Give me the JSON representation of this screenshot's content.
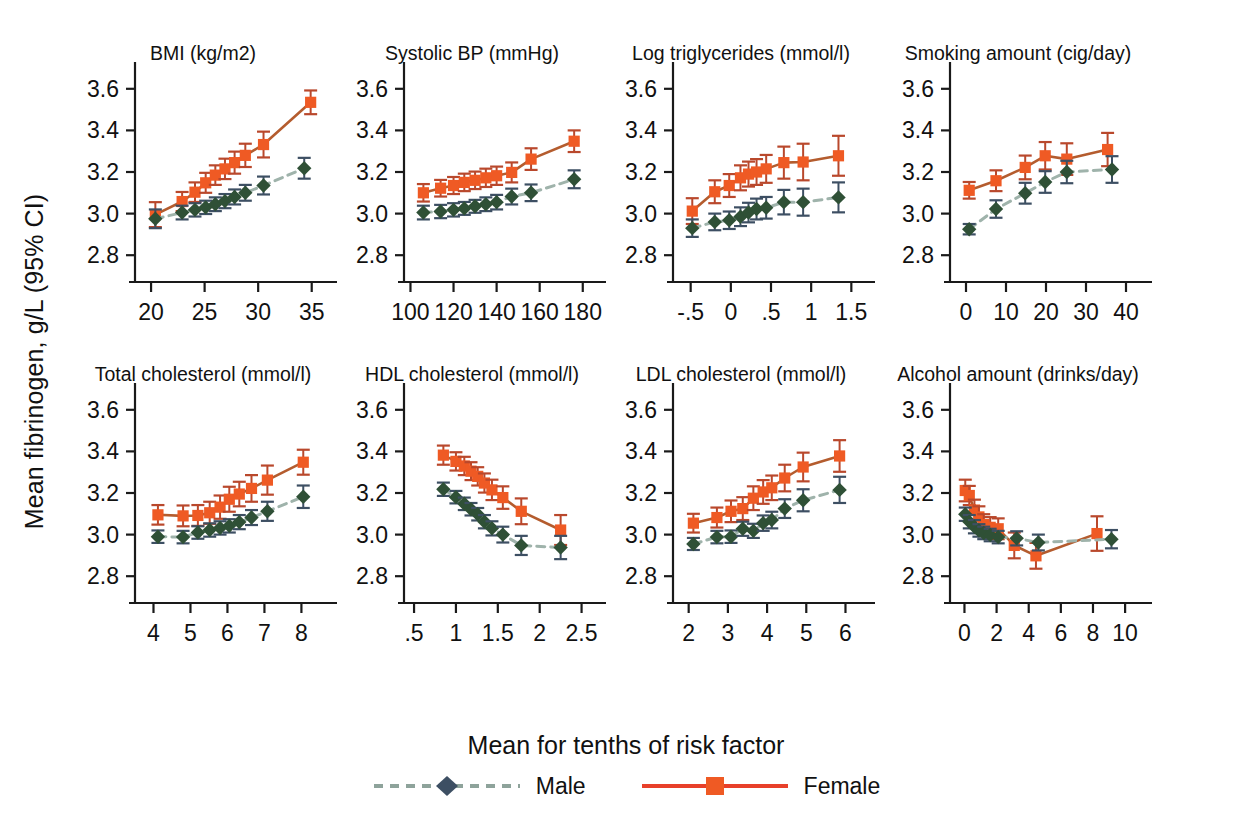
{
  "axis": {
    "ylabel": "Mean fibrinogen, g/L (95% CI)",
    "xlabel": "Mean for tenths of risk factor",
    "ylim": [
      2.7,
      3.7
    ],
    "yticks": [
      "2.8",
      "3.0",
      "3.2",
      "3.4",
      "3.6"
    ],
    "ytick_values": [
      2.8,
      3.0,
      3.2,
      3.4,
      3.6
    ]
  },
  "legend": {
    "position": "bottom-center",
    "items": [
      {
        "label": "Male",
        "marker": "diamond",
        "color": "#3d4f63",
        "line": "dashed",
        "line_color": "#8ea39b"
      },
      {
        "label": "Female",
        "marker": "square",
        "color": "#ef5a24",
        "line": "solid",
        "line_color": "#e03a26"
      }
    ]
  },
  "colors": {
    "female_marker": "#ef5a24",
    "female_line": "#b45c2e",
    "female_error": "#b9482c",
    "male_marker": "#2f5036",
    "male_line": "#9fb3ab",
    "male_error": "#3d4f63",
    "axis": "#1a1a1a"
  },
  "chart_data": [
    {
      "type": "scatter",
      "title": "BMI (kg/m2)",
      "xlabel": "",
      "ylabel": "Mean fibrinogen, g/L (95% CI)",
      "xlim": [
        18.5,
        36.8
      ],
      "ylim": [
        2.7,
        3.7
      ],
      "xticks": [
        "20",
        "25",
        "30",
        "35"
      ],
      "xtick_values": [
        20,
        25,
        30,
        35
      ],
      "grid": false,
      "series": [
        {
          "name": "Female",
          "x": [
            20.4,
            22.9,
            24.1,
            25.1,
            26.0,
            26.9,
            27.8,
            28.8,
            30.5,
            34.9
          ],
          "y": [
            2.995,
            3.058,
            3.103,
            3.148,
            3.185,
            3.215,
            3.245,
            3.28,
            3.332,
            3.535
          ],
          "lo": [
            2.935,
            3.012,
            3.056,
            3.1,
            3.138,
            3.166,
            3.192,
            3.224,
            3.27,
            3.478
          ],
          "hi": [
            3.055,
            3.104,
            3.15,
            3.196,
            3.232,
            3.264,
            3.298,
            3.336,
            3.394,
            3.592
          ]
        },
        {
          "name": "Male",
          "x": [
            20.4,
            22.9,
            24.1,
            25.1,
            26.0,
            26.9,
            27.8,
            28.8,
            30.5,
            34.3
          ],
          "y": [
            2.975,
            3.005,
            3.018,
            3.03,
            3.045,
            3.06,
            3.08,
            3.1,
            3.135,
            3.218
          ],
          "lo": [
            2.93,
            2.972,
            2.986,
            2.998,
            3.012,
            3.026,
            3.044,
            3.062,
            3.092,
            3.168
          ],
          "hi": [
            3.02,
            3.038,
            3.05,
            3.062,
            3.078,
            3.094,
            3.116,
            3.138,
            3.178,
            3.268
          ]
        }
      ]
    },
    {
      "type": "scatter",
      "title": "Systolic BP (mmHg)",
      "xlabel": "",
      "ylabel": "",
      "xlim": [
        97,
        188
      ],
      "ylim": [
        2.7,
        3.7
      ],
      "xticks": [
        "100",
        "120",
        "140",
        "160",
        "180"
      ],
      "xtick_values": [
        100,
        120,
        140,
        160,
        180
      ],
      "grid": false,
      "series": [
        {
          "name": "Female",
          "x": [
            106,
            114,
            120,
            125,
            130,
            135,
            140,
            147,
            156,
            176
          ],
          "y": [
            3.1,
            3.122,
            3.135,
            3.15,
            3.16,
            3.172,
            3.182,
            3.198,
            3.262,
            3.348
          ],
          "lo": [
            3.058,
            3.082,
            3.094,
            3.108,
            3.118,
            3.128,
            3.138,
            3.15,
            3.21,
            3.296
          ],
          "hi": [
            3.142,
            3.162,
            3.176,
            3.192,
            3.202,
            3.216,
            3.226,
            3.246,
            3.314,
            3.4
          ]
        },
        {
          "name": "Male",
          "x": [
            106,
            114,
            120,
            125,
            130,
            135,
            140,
            147,
            156,
            176
          ],
          "y": [
            3.005,
            3.01,
            3.018,
            3.025,
            3.035,
            3.045,
            3.055,
            3.082,
            3.1,
            3.165
          ],
          "lo": [
            2.972,
            2.978,
            2.986,
            2.994,
            3.004,
            3.012,
            3.02,
            3.044,
            3.06,
            3.122
          ],
          "hi": [
            3.038,
            3.042,
            3.05,
            3.056,
            3.066,
            3.078,
            3.09,
            3.12,
            3.14,
            3.208
          ]
        }
      ]
    },
    {
      "type": "scatter",
      "title": "Log triglycerides (mmol/l)",
      "xlabel": "",
      "ylabel": "",
      "xlim": [
        -0.72,
        1.72
      ],
      "ylim": [
        2.7,
        3.7
      ],
      "xticks": [
        "-.5",
        "0",
        ".5",
        "1",
        "1.5"
      ],
      "xtick_values": [
        -0.5,
        0,
        0.5,
        1,
        1.5
      ],
      "grid": false,
      "series": [
        {
          "name": "Female",
          "x": [
            -0.48,
            -0.2,
            -0.02,
            0.12,
            0.22,
            0.32,
            0.44,
            0.66,
            0.9,
            1.34
          ],
          "y": [
            3.012,
            3.105,
            3.135,
            3.172,
            3.19,
            3.2,
            3.215,
            3.245,
            3.248,
            3.278
          ],
          "lo": [
            2.95,
            3.05,
            3.08,
            3.112,
            3.13,
            3.138,
            3.148,
            3.168,
            3.16,
            3.182
          ],
          "hi": [
            3.074,
            3.16,
            3.19,
            3.232,
            3.25,
            3.262,
            3.282,
            3.322,
            3.336,
            3.374
          ]
        },
        {
          "name": "Male",
          "x": [
            -0.48,
            -0.2,
            -0.02,
            0.12,
            0.22,
            0.32,
            0.44,
            0.66,
            0.9,
            1.34
          ],
          "y": [
            2.93,
            2.96,
            2.968,
            2.985,
            3.005,
            3.022,
            3.028,
            3.055,
            3.055,
            3.078
          ],
          "lo": [
            2.888,
            2.92,
            2.926,
            2.94,
            2.958,
            2.972,
            2.976,
            2.996,
            2.99,
            3.006
          ],
          "hi": [
            2.972,
            3.0,
            3.01,
            3.03,
            3.052,
            3.072,
            3.08,
            3.114,
            3.12,
            3.15
          ]
        }
      ]
    },
    {
      "type": "scatter",
      "title": "Smoking amount (cig/day)",
      "xlabel": "",
      "ylabel": "",
      "xlim": [
        -4,
        45
      ],
      "ylim": [
        2.7,
        3.7
      ],
      "xticks": [
        "0",
        "10",
        "20",
        "30",
        "40"
      ],
      "xtick_values": [
        0,
        10,
        20,
        30,
        40
      ],
      "grid": false,
      "series": [
        {
          "name": "Female",
          "x": [
            0.8,
            7.5,
            14.8,
            19.8,
            25.2,
            35.4
          ],
          "y": [
            3.112,
            3.158,
            3.222,
            3.278,
            3.262,
            3.308
          ],
          "lo": [
            3.072,
            3.108,
            3.165,
            3.212,
            3.186,
            3.228
          ],
          "hi": [
            3.152,
            3.208,
            3.279,
            3.344,
            3.338,
            3.388
          ]
        },
        {
          "name": "Male",
          "x": [
            0.8,
            7.5,
            14.8,
            19.8,
            25.2,
            36.5
          ],
          "y": [
            2.925,
            3.022,
            3.098,
            3.152,
            3.2,
            3.212
          ],
          "lo": [
            2.9,
            2.98,
            3.048,
            3.1,
            3.146,
            3.148
          ],
          "hi": [
            2.95,
            3.064,
            3.148,
            3.204,
            3.254,
            3.276
          ]
        }
      ]
    },
    {
      "type": "scatter",
      "title": "Total cholesterol (mmol/l)",
      "xlabel": "",
      "ylabel": "",
      "xlim": [
        3.5,
        8.8
      ],
      "ylim": [
        2.7,
        3.7
      ],
      "xticks": [
        "4",
        "5",
        "6",
        "7",
        "8"
      ],
      "xtick_values": [
        4,
        5,
        6,
        7,
        8
      ],
      "grid": false,
      "series": [
        {
          "name": "Female",
          "x": [
            4.12,
            4.8,
            5.2,
            5.52,
            5.8,
            6.05,
            6.32,
            6.65,
            7.08,
            8.05
          ],
          "y": [
            3.095,
            3.09,
            3.092,
            3.105,
            3.132,
            3.17,
            3.195,
            3.222,
            3.262,
            3.348
          ],
          "lo": [
            3.048,
            3.04,
            3.042,
            3.052,
            3.076,
            3.11,
            3.136,
            3.158,
            3.192,
            3.288
          ],
          "hi": [
            3.142,
            3.14,
            3.142,
            3.158,
            3.188,
            3.23,
            3.254,
            3.286,
            3.332,
            3.408
          ]
        },
        {
          "name": "Male",
          "x": [
            4.12,
            4.8,
            5.2,
            5.52,
            5.8,
            6.05,
            6.32,
            6.65,
            7.08,
            8.05
          ],
          "y": [
            2.99,
            2.988,
            3.01,
            3.022,
            3.032,
            3.042,
            3.06,
            3.082,
            3.112,
            3.182
          ],
          "lo": [
            2.96,
            2.958,
            2.98,
            2.99,
            3.0,
            3.01,
            3.026,
            3.046,
            3.066,
            3.128
          ],
          "hi": [
            3.02,
            3.018,
            3.04,
            3.054,
            3.064,
            3.074,
            3.094,
            3.118,
            3.158,
            3.236
          ]
        }
      ]
    },
    {
      "type": "scatter",
      "title": "HDL cholesterol (mmol/l)",
      "xlabel": "",
      "ylabel": "",
      "xlim": [
        0.38,
        2.72
      ],
      "ylim": [
        2.7,
        3.7
      ],
      "xticks": [
        ".5",
        "1",
        "1.5",
        "2",
        "2.5"
      ],
      "xtick_values": [
        0.5,
        1,
        1.5,
        2,
        2.5
      ],
      "grid": false,
      "series": [
        {
          "name": "Female",
          "x": [
            0.85,
            1.0,
            1.1,
            1.18,
            1.26,
            1.34,
            1.43,
            1.56,
            1.78,
            2.25
          ],
          "y": [
            3.382,
            3.352,
            3.33,
            3.305,
            3.28,
            3.248,
            3.215,
            3.178,
            3.112,
            3.022
          ],
          "lo": [
            3.336,
            3.308,
            3.286,
            3.262,
            3.236,
            3.202,
            3.166,
            3.124,
            3.05,
            2.95
          ],
          "hi": [
            3.428,
            3.396,
            3.374,
            3.348,
            3.324,
            3.294,
            3.264,
            3.232,
            3.174,
            3.094
          ]
        },
        {
          "name": "Male",
          "x": [
            0.85,
            1.0,
            1.1,
            1.18,
            1.26,
            1.34,
            1.43,
            1.56,
            1.78,
            2.25
          ],
          "y": [
            3.218,
            3.18,
            3.148,
            3.122,
            3.098,
            3.062,
            3.03,
            3.0,
            2.948,
            2.938
          ],
          "lo": [
            3.186,
            3.15,
            3.118,
            3.092,
            3.068,
            3.03,
            2.996,
            2.962,
            2.902,
            2.882
          ],
          "hi": [
            3.25,
            3.21,
            3.178,
            3.152,
            3.128,
            3.094,
            3.064,
            3.038,
            2.994,
            2.994
          ]
        }
      ]
    },
    {
      "type": "scatter",
      "title": "LDL cholesterol (mmol/l)",
      "xlabel": "",
      "ylabel": "",
      "xlim": [
        1.6,
        6.6
      ],
      "ylim": [
        2.7,
        3.7
      ],
      "xticks": [
        "2",
        "3",
        "4",
        "5",
        "6"
      ],
      "xtick_values": [
        2,
        3,
        4,
        5,
        6
      ],
      "grid": false,
      "series": [
        {
          "name": "Female",
          "x": [
            2.12,
            2.72,
            3.08,
            3.38,
            3.65,
            3.9,
            4.12,
            4.45,
            4.92,
            5.85
          ],
          "y": [
            3.055,
            3.082,
            3.112,
            3.125,
            3.175,
            3.205,
            3.225,
            3.272,
            3.325,
            3.378
          ],
          "lo": [
            3.01,
            3.034,
            3.06,
            3.07,
            3.118,
            3.148,
            3.166,
            3.208,
            3.256,
            3.302
          ],
          "hi": [
            3.1,
            3.13,
            3.164,
            3.18,
            3.232,
            3.262,
            3.284,
            3.336,
            3.394,
            3.454
          ]
        },
        {
          "name": "Male",
          "x": [
            2.12,
            2.72,
            3.08,
            3.38,
            3.65,
            3.9,
            4.12,
            4.45,
            4.92,
            5.85
          ],
          "y": [
            2.955,
            2.988,
            2.99,
            3.028,
            3.018,
            3.055,
            3.07,
            3.125,
            3.165,
            3.215
          ],
          "lo": [
            2.926,
            2.958,
            2.96,
            2.994,
            2.984,
            3.018,
            3.03,
            3.08,
            3.112,
            3.152
          ],
          "hi": [
            2.984,
            3.018,
            3.02,
            3.062,
            3.052,
            3.092,
            3.11,
            3.17,
            3.218,
            3.278
          ]
        }
      ]
    },
    {
      "type": "scatter",
      "title": "Alcohol amount (drinks/day)",
      "xlabel": "",
      "ylabel": "",
      "xlim": [
        -0.9,
        11.3
      ],
      "ylim": [
        2.7,
        3.7
      ],
      "xticks": [
        "0",
        "2",
        "4",
        "6",
        "8",
        "10"
      ],
      "xtick_values": [
        0,
        2,
        4,
        6,
        8,
        10
      ],
      "grid": false,
      "series": [
        {
          "name": "Female",
          "x": [
            0.05,
            0.3,
            0.62,
            0.9,
            1.2,
            1.6,
            2.1,
            3.1,
            4.45,
            8.25
          ],
          "y": [
            3.212,
            3.188,
            3.118,
            3.085,
            3.048,
            3.035,
            3.028,
            2.948,
            2.898,
            3.005
          ],
          "lo": [
            3.16,
            3.142,
            3.068,
            3.034,
            2.998,
            2.986,
            2.978,
            2.886,
            2.836,
            2.922
          ],
          "hi": [
            3.264,
            3.234,
            3.168,
            3.136,
            3.098,
            3.084,
            3.078,
            3.01,
            2.96,
            3.088
          ]
        },
        {
          "name": "Male",
          "x": [
            0.05,
            0.3,
            0.62,
            0.9,
            1.2,
            1.6,
            2.1,
            3.25,
            4.6,
            9.15
          ],
          "y": [
            3.098,
            3.062,
            3.038,
            3.02,
            3.008,
            2.998,
            2.988,
            2.982,
            2.962,
            2.978
          ],
          "lo": [
            3.066,
            3.03,
            3.006,
            2.99,
            2.978,
            2.968,
            2.958,
            2.948,
            2.924,
            2.934
          ],
          "hi": [
            3.13,
            3.094,
            3.07,
            3.05,
            3.038,
            3.028,
            3.018,
            3.016,
            3.0,
            3.022
          ]
        }
      ]
    }
  ]
}
